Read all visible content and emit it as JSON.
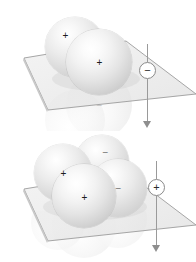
{
  "figure": {
    "background_color": "#ffffff",
    "width": 196,
    "height": 262
  },
  "panels": [
    {
      "id": "panel-top",
      "name": "two-sphere-configuration",
      "sphere_count": 2,
      "spheres": [
        {
          "name": "back-sphere",
          "sign": "+",
          "cx": 75,
          "cy": 47,
          "r": 30,
          "shade": "back"
        },
        {
          "name": "front-sphere",
          "sign": "+",
          "cx": 99,
          "cy": 62,
          "r": 33,
          "shade": "solid"
        }
      ],
      "mirror_spheres": [
        {
          "name": "mirror-sphere",
          "sign": "−",
          "cx": 99,
          "cy": 105,
          "r": 33
        }
      ],
      "plane": {
        "name": "reflection-plane"
      },
      "point_charge": {
        "sign": "−",
        "label": "negative-point-charge",
        "cx": 147,
        "cy": 70
      },
      "field_line": {
        "x": 147,
        "y_top": 44,
        "y_bottom": 128,
        "arrow_direction": "down"
      }
    },
    {
      "id": "panel-bottom",
      "name": "four-sphere-configuration",
      "sphere_count": 4,
      "spheres": [
        {
          "name": "back-left-sphere",
          "sign": "+",
          "cx": 63,
          "cy": 173,
          "r": 29,
          "shade": "back"
        },
        {
          "name": "back-right-sphere",
          "sign": "−",
          "cx": 106,
          "cy": 166,
          "r": 27,
          "shade": "back"
        },
        {
          "name": "front-right-sphere",
          "sign": "−",
          "cx": 118,
          "cy": 188,
          "r": 29,
          "shade": "back"
        },
        {
          "name": "front-left-sphere",
          "sign": "+",
          "cx": 84,
          "cy": 196,
          "r": 32,
          "shade": "solid"
        }
      ],
      "mirror_spheres": [],
      "plane": {
        "name": "reflection-plane"
      },
      "point_charge": {
        "sign": "+",
        "label": "positive-point-charge",
        "cx": 156,
        "cy": 187
      },
      "field_line": {
        "x": 156,
        "y_top": 161,
        "y_bottom": 252,
        "arrow_direction": "down"
      }
    }
  ],
  "colors": {
    "plane_fill": "#e8e8e8",
    "plane_edge": "#9c9c9c",
    "sphere_light": "#ffffff",
    "sphere_dark": "#c0c0c0",
    "line": "#9a9a9a",
    "glyph": "#1d1d1d",
    "glyph_faint": "#c2c2c2"
  },
  "glyphs": {
    "plus": "+",
    "minus": "−"
  }
}
